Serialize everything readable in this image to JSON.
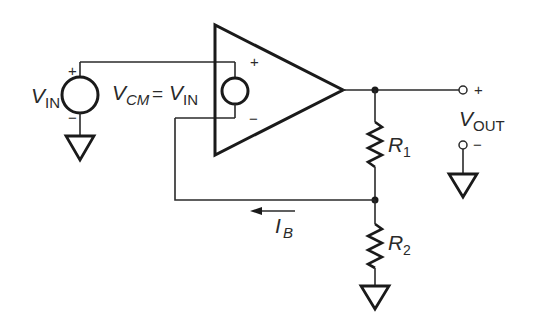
{
  "diagram": {
    "type": "op-amp circuit",
    "colors": {
      "line": "#1a1a1a",
      "background": "#ffffff"
    },
    "labels": {
      "vin_main": "V",
      "vin_sub": "IN",
      "vin_plus": "+",
      "vin_minus": "−",
      "vcm_main": "V",
      "vcm_sub": "CM",
      "vcm_eq": "=",
      "vcm_rhs_main": "V",
      "vcm_rhs_sub": "IN",
      "opamp_plus": "+",
      "opamp_minus": "−",
      "vout_main": "V",
      "vout_sub": "OUT",
      "vout_plus": "+",
      "vout_minus": "−",
      "r1_main": "R",
      "r1_sub": "1",
      "r2_main": "R",
      "r2_sub": "2",
      "ib_main": "I",
      "ib_sub": "B"
    },
    "components": [
      {
        "id": "vin-source",
        "kind": "voltage-source",
        "label": "V_IN"
      },
      {
        "id": "vcm-source",
        "kind": "voltage-source",
        "label": "V_CM = V_IN"
      },
      {
        "id": "op-amp",
        "kind": "op-amp"
      },
      {
        "id": "r1",
        "kind": "resistor",
        "label": "R1"
      },
      {
        "id": "r2",
        "kind": "resistor",
        "label": "R2"
      },
      {
        "id": "ground-vin",
        "kind": "ground"
      },
      {
        "id": "ground-r2",
        "kind": "ground"
      },
      {
        "id": "ground-vout",
        "kind": "ground"
      },
      {
        "id": "ib-arrow",
        "kind": "current-arrow",
        "label": "I_B"
      }
    ]
  }
}
